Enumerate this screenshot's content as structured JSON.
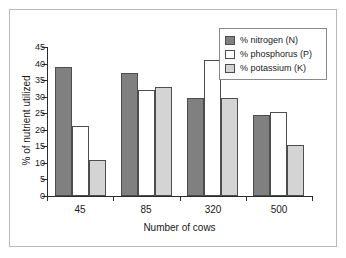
{
  "chart_data": {
    "type": "bar",
    "title": "",
    "xlabel": "Number of cows",
    "ylabel": "% of nutrient utilized",
    "categories": [
      "45",
      "85",
      "320",
      "500"
    ],
    "series": [
      {
        "name": "% nitrogen (N)",
        "color": "#808080",
        "values": [
          39,
          37,
          29.5,
          24.5
        ]
      },
      {
        "name": "% phosphorus (P)",
        "color": "#ffffff",
        "values": [
          21,
          32,
          41,
          25.5
        ]
      },
      {
        "name": "% potassium (K)",
        "color": "#d4d4d4",
        "values": [
          11,
          33,
          29.5,
          15.5
        ]
      }
    ],
    "ylim": [
      0,
      45
    ],
    "yticks": [
      0,
      5,
      10,
      15,
      20,
      25,
      30,
      35,
      40,
      45
    ],
    "ytick_labels": [
      "0",
      "5",
      "10",
      "15",
      "20",
      "25",
      "30",
      "35",
      "40",
      "45"
    ],
    "grid": false,
    "legend_position": "top-right"
  },
  "legend": {
    "items": [
      {
        "label": "% nitrogen (N)"
      },
      {
        "label": "% phosphorus (P)"
      },
      {
        "label": "% potassium (K)"
      }
    ]
  }
}
